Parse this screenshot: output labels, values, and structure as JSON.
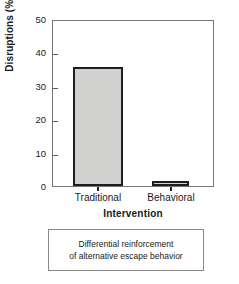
{
  "chart_data": {
    "type": "bar",
    "title": "",
    "categories": [
      "Traditional",
      "Behavioral"
    ],
    "values": [
      35.6,
      1.5
    ],
    "xlabel": "Intervention",
    "ylabel": "Disruptions (%)",
    "ylim": [
      0,
      50
    ],
    "yticks": [
      0,
      10,
      20,
      30,
      40,
      50
    ],
    "ytick_labels": [
      "0",
      "10",
      "20",
      "30",
      "40",
      "50"
    ],
    "grid": false,
    "legend": "none",
    "bar_fill_color": "#d2d2d0",
    "bar_edge_color": "#1e1e1e",
    "frame_color": "#767676"
  },
  "caption": {
    "line1": "Differential reinforcement",
    "line2": "of alternative escape behavior"
  }
}
